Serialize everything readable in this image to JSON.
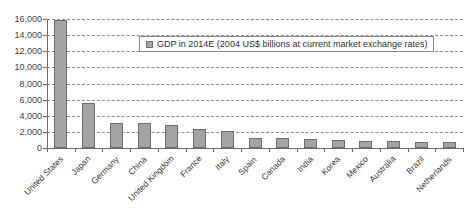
{
  "chart_data": {
    "type": "bar",
    "title": "",
    "xlabel": "",
    "ylabel": "",
    "ylim": [
      0,
      16000
    ],
    "ytick_step": 2000,
    "grid": true,
    "legend_position": "top-center",
    "bar_color": "#a3a3a3",
    "bar_border_color": "#6e6e6e",
    "gridline_color": "#8f8f8f",
    "axis_color": "#6b6b6b",
    "series_name": "GDP in 2014E (2004 US$ billions at current market exchange rates)",
    "categories": [
      "United States",
      "Japan",
      "Germany",
      "China",
      "United Kingdom",
      "France",
      "Italy",
      "Spain",
      "Canada",
      "India",
      "Korea",
      "Mexico",
      "Australia",
      "Brazil",
      "Netherlands"
    ],
    "values": [
      15900,
      5600,
      3150,
      3150,
      2800,
      2400,
      2050,
      1300,
      1300,
      1150,
      1050,
      900,
      880,
      780,
      700
    ],
    "ytick_labels": [
      "16,000",
      "14,000",
      "12,000",
      "10,000",
      "8,000",
      "6,000",
      "4,000",
      "2,000",
      "0"
    ],
    "ytick_values": [
      16000,
      14000,
      12000,
      10000,
      8000,
      6000,
      4000,
      2000,
      0
    ]
  },
  "legend": {
    "entries": [
      {
        "label": "GDP in 2014E (2004 US$ billions at current market exchange rates)",
        "color": "#a3a3a3"
      }
    ]
  }
}
